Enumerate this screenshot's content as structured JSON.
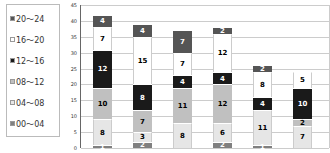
{
  "chart_data": {
    "type": "bar",
    "stacked": true,
    "title": "",
    "xlabel": "",
    "ylabel": "",
    "ylim": [
      0,
      45
    ],
    "yticks": [
      0,
      5,
      10,
      15,
      20,
      25,
      30,
      35,
      40,
      45
    ],
    "grid": true,
    "legend_position": "left",
    "categories": [
      "1",
      "2",
      "3",
      "4",
      "5",
      "6"
    ],
    "series": [
      {
        "name": "00〜04",
        "color": "#808080",
        "text": "#fff",
        "values": [
          1,
          2,
          0,
          2,
          1,
          0
        ]
      },
      {
        "name": "04〜08",
        "color": "#e6e6e6",
        "text": "#000",
        "values": [
          8,
          3,
          8,
          6,
          11,
          7
        ]
      },
      {
        "name": "08〜12",
        "color": "#c0c0c0",
        "text": "#000",
        "values": [
          10,
          7,
          11,
          12,
          0,
          2
        ]
      },
      {
        "name": "12〜16",
        "color": "#1a1a1a",
        "text": "#fff",
        "values": [
          12,
          8,
          4,
          4,
          4,
          10
        ]
      },
      {
        "name": "16〜20",
        "color": "#ffffff",
        "text": "#000",
        "values": [
          7,
          15,
          7,
          12,
          8,
          5
        ]
      },
      {
        "name": "20〜24",
        "color": "#555555",
        "text": "#fff",
        "values": [
          4,
          4,
          7,
          2,
          2,
          0
        ]
      }
    ]
  }
}
